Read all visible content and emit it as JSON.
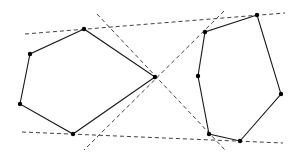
{
  "diagram": {
    "colors": {
      "background": "#ffffff",
      "edge": "#1a1a1a",
      "dashed": "#2a2a2a",
      "vertex": "#000000"
    },
    "polygons": [
      {
        "name": "left-polygon",
        "vertices": [
          [
            84,
            29
          ],
          [
            30,
            54
          ],
          [
            20,
            104
          ],
          [
            73,
            134
          ],
          [
            155,
            77
          ]
        ]
      },
      {
        "name": "right-polygon",
        "vertices": [
          [
            257,
            15
          ],
          [
            205,
            32
          ],
          [
            198,
            76
          ],
          [
            209,
            134
          ],
          [
            240,
            141
          ],
          [
            281,
            94
          ]
        ]
      }
    ],
    "tangent_lines": [
      {
        "name": "outer-top-tangent",
        "from": [
          25,
          34
        ],
        "to": [
          285,
          13
        ]
      },
      {
        "name": "outer-bottom-tangent",
        "from": [
          22,
          132
        ],
        "to": [
          283,
          143
        ]
      },
      {
        "name": "inner-tangent-descending",
        "from": [
          97,
          14
        ],
        "to": [
          225,
          150
        ]
      },
      {
        "name": "inner-tangent-ascending",
        "from": [
          224,
          11
        ],
        "to": [
          84,
          150
        ]
      }
    ]
  }
}
